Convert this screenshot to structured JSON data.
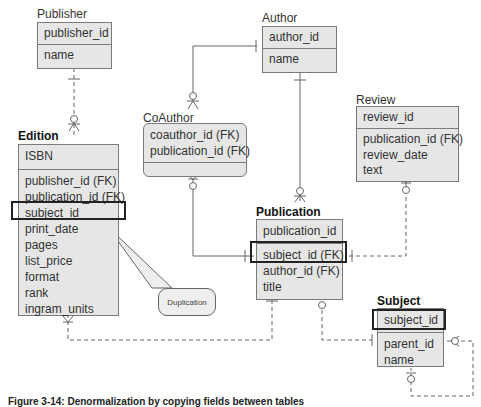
{
  "entities": {
    "publisher": {
      "name": "Publisher",
      "pk": "publisher_id",
      "attributes": [
        "name"
      ]
    },
    "author": {
      "name": "Author",
      "pk": "author_id",
      "attributes": [
        "name"
      ]
    },
    "coauthor": {
      "name": "CoAuthor",
      "keys": [
        "coauthor_id (FK)",
        "publication_id (FK)"
      ],
      "attributes": []
    },
    "review": {
      "name": "Review",
      "pk": "review_id",
      "attributes": [
        "publication_id (FK)",
        "review_date",
        "text"
      ]
    },
    "edition": {
      "name": "Edition",
      "pk": "ISBN",
      "attributes": [
        "publisher_id (FK)",
        "publication_id (FK)",
        "subject_id",
        "print_date",
        "pages",
        "list_price",
        "format",
        "rank",
        "ingram_units"
      ]
    },
    "publication": {
      "name": "Publication",
      "pk": "publication_id",
      "attributes": [
        "subject_id (FK)",
        "author_id (FK)",
        "title"
      ]
    },
    "subject": {
      "name": "Subject",
      "pk": "subject_id",
      "attributes": [
        "parent_id",
        "name"
      ]
    }
  },
  "callout": {
    "text": "Duplication"
  },
  "caption": "Figure 3-14: Denormalization by copying fields between tables",
  "colors": {
    "entity_fill": "#e6e6e6",
    "entity_border": "#7a7a7a",
    "highlight_border": "#222222",
    "line": "#666666"
  }
}
